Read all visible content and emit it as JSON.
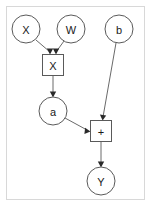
{
  "diagram": {
    "background_color": "#ffffff",
    "frame": {
      "border_color": "#d8d8d8",
      "x": 6,
      "y": 6,
      "width": 139,
      "height": 194
    },
    "nodes": [
      {
        "id": "x_in",
        "label": "X",
        "shape": "circle",
        "cx": 26,
        "cy": 29,
        "r": 14
      },
      {
        "id": "w_in",
        "label": "W",
        "shape": "circle",
        "cx": 71,
        "cy": 29,
        "r": 14
      },
      {
        "id": "b_in",
        "label": "b",
        "shape": "circle",
        "cx": 119,
        "cy": 29,
        "r": 14
      },
      {
        "id": "mul",
        "label": "X",
        "shape": "box",
        "cx": 53,
        "cy": 65,
        "w": 21,
        "h": 21
      },
      {
        "id": "a_out",
        "label": "a",
        "shape": "circle",
        "cx": 53,
        "cy": 111,
        "r": 14
      },
      {
        "id": "add",
        "label": "+",
        "shape": "box",
        "cx": 101,
        "cy": 131,
        "w": 21,
        "h": 21
      },
      {
        "id": "y_out",
        "label": "Y",
        "shape": "circle",
        "cx": 101,
        "cy": 181,
        "r": 14
      }
    ],
    "edges": [
      {
        "id": "x-to-mul",
        "from": "x_in",
        "to": "mul",
        "x1": 36,
        "y1": 40,
        "x2": 50,
        "y2": 53,
        "arrow": "down"
      },
      {
        "id": "w-to-mul",
        "from": "w_in",
        "to": "mul",
        "x1": 64,
        "y1": 41,
        "x2": 56,
        "y2": 53,
        "arrow": "down"
      },
      {
        "id": "mul-to-a",
        "from": "mul",
        "to": "a_out",
        "x1": 53,
        "y1": 76,
        "x2": 53,
        "y2": 96,
        "arrow": "down"
      },
      {
        "id": "b-to-add",
        "from": "b_in",
        "to": "add",
        "x1": 116,
        "y1": 43,
        "x2": 103,
        "y2": 119,
        "arrow": "down"
      },
      {
        "id": "a-to-add",
        "from": "a_out",
        "to": "add",
        "x1": 65,
        "y1": 118,
        "x2": 89,
        "y2": 130,
        "arrow": "right"
      },
      {
        "id": "add-to-y",
        "from": "add",
        "to": "y_out",
        "x1": 101,
        "y1": 142,
        "x2": 101,
        "y2": 166,
        "arrow": "down"
      }
    ],
    "colors": {
      "node_stroke": "#5a5a5a",
      "edge_stroke": "#6a6a6a",
      "label_text": "#1a1a1a",
      "frame_border": "#d8d8d8"
    }
  }
}
